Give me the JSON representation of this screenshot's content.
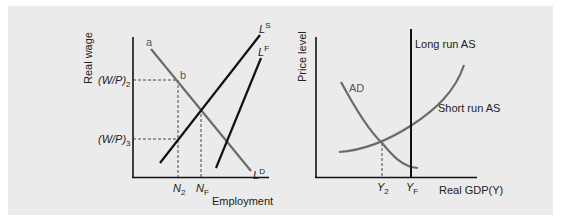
{
  "figure": {
    "background_color": "#ebebeb",
    "left_panel": {
      "y_axis_label": "Real wage",
      "x_axis_label": "Employment",
      "y_ticks": {
        "w_p_2": {
          "base": "(W/P)",
          "sub": "2"
        },
        "w_p_3": {
          "base": "(W/P)",
          "sub": "3"
        }
      },
      "x_ticks": {
        "n_2": {
          "base": "N",
          "sub": "2"
        },
        "n_f": {
          "base": "N",
          "sub": "F"
        }
      },
      "point_labels": {
        "a": "a",
        "b": "b"
      },
      "curves": {
        "labor_demand": {
          "base": "L",
          "sup": "D",
          "color": "#6b6b6b"
        },
        "labor_supply": {
          "base": "L",
          "sup": "S",
          "color": "#111111"
        },
        "labor_force": {
          "base": "L",
          "sup": "F",
          "color": "#111111"
        }
      }
    },
    "right_panel": {
      "y_axis_label": "Price level",
      "x_axis_label": "Real GDP(Y)",
      "x_ticks": {
        "y_2": {
          "base": "Y",
          "sub": "2"
        },
        "y_f": {
          "base": "Y",
          "sub": "F"
        }
      },
      "curves": {
        "aggregate_demand": {
          "label": "AD",
          "color": "#6b6b6b"
        },
        "short_run_as": {
          "label": "Short run AS",
          "color": "#6b6b6b"
        },
        "long_run_as": {
          "label": "Long run AS",
          "color": "#111111"
        }
      }
    }
  }
}
